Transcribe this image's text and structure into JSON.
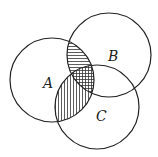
{
  "diagram": {
    "type": "venn",
    "sets": [
      {
        "label": "A",
        "cx": 52,
        "cy": 80,
        "r": 42
      },
      {
        "label": "B",
        "cx": 109,
        "cy": 55,
        "r": 42
      },
      {
        "label": "C",
        "cx": 97,
        "cy": 107,
        "r": 42
      }
    ],
    "labels": {
      "A": "A",
      "B": "B",
      "C": "C"
    },
    "shaded_regions": [
      {
        "region": "A∩B (not C)",
        "pattern": "horizontal-lines"
      },
      {
        "region": "A∩C (not B)",
        "pattern": "vertical-lines"
      },
      {
        "region": "A∩B∩C",
        "pattern": "grid"
      }
    ],
    "stroke_color": "#222222",
    "background": "#ffffff"
  }
}
